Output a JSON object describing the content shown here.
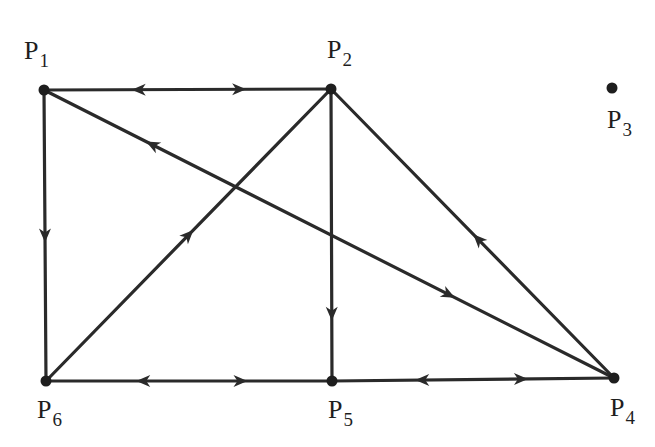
{
  "diagram": {
    "type": "directed-graph",
    "colors": {
      "background": "#ffffff",
      "edge": "#2a2a2a",
      "node": "#1e1e1e",
      "text": "#1e1e1e"
    },
    "nodes": [
      {
        "id": "P1",
        "letter": "P",
        "sub": "1",
        "x": 44,
        "y": 90,
        "label_x": 24,
        "label_y": 38
      },
      {
        "id": "P2",
        "letter": "P",
        "sub": "2",
        "x": 331,
        "y": 89,
        "label_x": 327,
        "label_y": 37
      },
      {
        "id": "P3",
        "letter": "P",
        "sub": "3",
        "x": 612,
        "y": 88,
        "label_x": 607,
        "label_y": 107
      },
      {
        "id": "P4",
        "letter": "P",
        "sub": "4",
        "x": 614,
        "y": 378,
        "label_x": 610,
        "label_y": 395
      },
      {
        "id": "P5",
        "letter": "P",
        "sub": "5",
        "x": 332,
        "y": 381,
        "label_x": 328,
        "label_y": 397
      },
      {
        "id": "P6",
        "letter": "P",
        "sub": "6",
        "x": 46,
        "y": 381,
        "label_x": 37,
        "label_y": 397
      }
    ],
    "edges": [
      {
        "from": "P1",
        "to": "P2",
        "arrows": [
          {
            "t": 0.33,
            "dir": "backward"
          },
          {
            "t": 0.68,
            "dir": "forward"
          }
        ]
      },
      {
        "from": "P1",
        "to": "P6",
        "arrows": [
          {
            "t": 0.5,
            "dir": "forward"
          }
        ]
      },
      {
        "from": "P1",
        "to": "P4",
        "arrows": [
          {
            "t": 0.19,
            "dir": "backward"
          },
          {
            "t": 0.71,
            "dir": "forward"
          }
        ]
      },
      {
        "from": "P6",
        "to": "P2",
        "arrows": [
          {
            "t": 0.5,
            "dir": "forward"
          }
        ]
      },
      {
        "from": "P2",
        "to": "P5",
        "arrows": [
          {
            "t": 0.77,
            "dir": "forward"
          }
        ]
      },
      {
        "from": "P4",
        "to": "P2",
        "arrows": [
          {
            "t": 0.48,
            "dir": "forward"
          }
        ]
      },
      {
        "from": "P6",
        "to": "P5",
        "arrows": [
          {
            "t": 0.34,
            "dir": "backward"
          },
          {
            "t": 0.68,
            "dir": "forward"
          }
        ]
      },
      {
        "from": "P5",
        "to": "P4",
        "arrows": [
          {
            "t": 0.32,
            "dir": "backward"
          },
          {
            "t": 0.67,
            "dir": "forward"
          }
        ]
      }
    ]
  }
}
